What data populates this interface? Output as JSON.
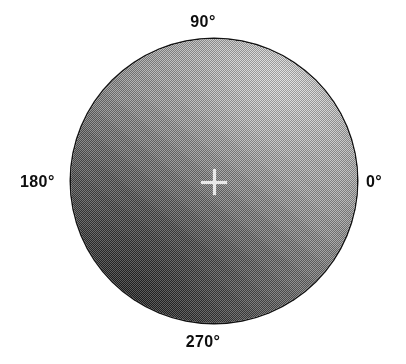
{
  "figure": {
    "kind": "polar-angular-diagram",
    "background_color": "#ffffff",
    "outline_color": "#121212",
    "center_marker": {
      "name": "crosshair",
      "glyph": "+",
      "color": "#e8e8e8",
      "x": 214,
      "y": 182
    },
    "disk": {
      "center_x": 214,
      "center_y": 181,
      "radius": 143,
      "texture": "halftone-checkerboard-dither",
      "shading": "diagonal-luminance-gradient",
      "bright_quadrant": "upper-right",
      "dark_quadrant": "lower-left",
      "light_color": "#c9c9c9",
      "dark_color": "#434343"
    }
  },
  "labels": {
    "top": "90°",
    "left": "180°",
    "right": "0°",
    "bottom": "270°"
  },
  "chart_data": {
    "type": "heatmap",
    "title": "",
    "xlabel": "",
    "ylabel": "",
    "projection": "polar",
    "grid": false,
    "legend": "none",
    "angle_unit": "degrees",
    "angular_ticks": [
      0,
      90,
      180,
      270
    ],
    "angular_tick_labels": [
      "0°",
      "90°",
      "180°",
      "270°"
    ],
    "angular_tick_positions": [
      "right",
      "top",
      "left",
      "bottom"
    ],
    "angle_direction": "counter-clockwise",
    "radial_range": [
      0,
      1
    ],
    "colormap": "grayscale",
    "intensity_range": [
      0.26,
      0.79
    ],
    "annotations": [
      {
        "type": "marker",
        "label": "center",
        "glyph": "+",
        "r": 0,
        "theta": 0
      }
    ],
    "samples": [
      {
        "theta": 0,
        "r": 0.95,
        "intensity": 0.52
      },
      {
        "theta": 45,
        "r": 0.95,
        "intensity": 0.74
      },
      {
        "theta": 90,
        "r": 0.95,
        "intensity": 0.72
      },
      {
        "theta": 135,
        "r": 0.95,
        "intensity": 0.62
      },
      {
        "theta": 180,
        "r": 0.95,
        "intensity": 0.47
      },
      {
        "theta": 225,
        "r": 0.95,
        "intensity": 0.28
      },
      {
        "theta": 270,
        "r": 0.95,
        "intensity": 0.3
      },
      {
        "theta": 315,
        "r": 0.95,
        "intensity": 0.4
      },
      {
        "theta": 0,
        "r": 0.5,
        "intensity": 0.55
      },
      {
        "theta": 45,
        "r": 0.5,
        "intensity": 0.66
      },
      {
        "theta": 90,
        "r": 0.5,
        "intensity": 0.64
      },
      {
        "theta": 135,
        "r": 0.5,
        "intensity": 0.58
      },
      {
        "theta": 180,
        "r": 0.5,
        "intensity": 0.5
      },
      {
        "theta": 225,
        "r": 0.5,
        "intensity": 0.38
      },
      {
        "theta": 270,
        "r": 0.5,
        "intensity": 0.4
      },
      {
        "theta": 315,
        "r": 0.5,
        "intensity": 0.47
      },
      {
        "theta": 0,
        "r": 0.0,
        "intensity": 0.52
      }
    ]
  }
}
